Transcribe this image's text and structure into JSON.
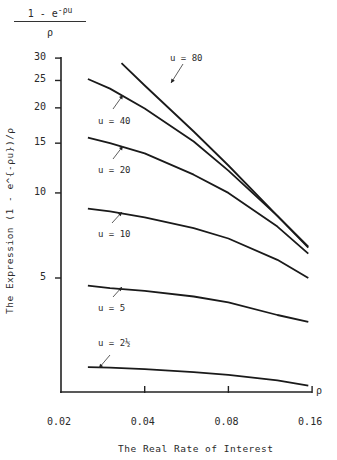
{
  "chart_data": {
    "type": "line",
    "title": "",
    "top_label": {
      "numerator": "1 - e",
      "exponent": "-ρu",
      "denominator": "ρ"
    },
    "xlabel": "The Real Rate of Interest",
    "ylabel": "The Expression (1 - e^{-ρu})/ρ",
    "x_axis_symbol": "ρ",
    "x_scale": "log",
    "y_scale": "log",
    "xlim": [
      0.02,
      0.16
    ],
    "ylim": [
      2,
      30
    ],
    "x_ticks": [
      "0.02",
      "0.04",
      "0.08",
      "0.16"
    ],
    "y_ticks": [
      "5",
      "10",
      "15",
      "20",
      "25",
      "30"
    ],
    "grid": false,
    "legend": "inline labels with arrows",
    "x": [
      0.025,
      0.03,
      0.04,
      0.06,
      0.08,
      0.12,
      0.155
    ],
    "series": [
      {
        "name": "u = 80",
        "x": [
          0.033,
          0.04,
          0.06,
          0.08,
          0.12,
          0.155
        ],
        "values": [
          28.8,
          24.0,
          16.5,
          12.5,
          8.3,
          6.45
        ]
      },
      {
        "name": "u = 40",
        "values": [
          25.3,
          23.4,
          19.9,
          15.2,
          12.0,
          8.3,
          6.4
        ]
      },
      {
        "name": "u = 20",
        "values": [
          15.7,
          15.0,
          13.8,
          11.6,
          10.0,
          7.6,
          6.1
        ]
      },
      {
        "name": "u = 10",
        "values": [
          8.8,
          8.6,
          8.2,
          7.5,
          6.9,
          5.8,
          5.0
        ]
      },
      {
        "name": "u = 5",
        "values": [
          4.7,
          4.6,
          4.5,
          4.3,
          4.1,
          3.7,
          3.5
        ]
      },
      {
        "name": "u = 2½",
        "values": [
          2.42,
          2.41,
          2.38,
          2.32,
          2.27,
          2.17,
          2.08
        ]
      }
    ]
  }
}
